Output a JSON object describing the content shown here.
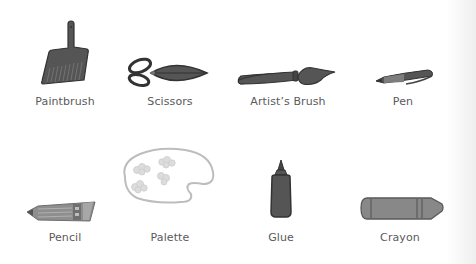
{
  "colors": {
    "icon_fill": "#555555",
    "icon_stroke": "#333333",
    "light_fill": "#8a8a8a",
    "palette_stroke": "#bdbdbd",
    "palette_spot": "#d8d8d8",
    "label_text": "#5a5a5a",
    "background": "#ffffff"
  },
  "items": [
    {
      "label": "Paintbrush",
      "icon": "paintbrush-icon"
    },
    {
      "label": "Scissors",
      "icon": "scissors-icon"
    },
    {
      "label": "Artist’s Brush",
      "icon": "artist-brush-icon"
    },
    {
      "label": "Pen",
      "icon": "pen-icon"
    },
    {
      "label": "Pencil",
      "icon": "pencil-icon"
    },
    {
      "label": "Palette",
      "icon": "palette-icon"
    },
    {
      "label": "Glue",
      "icon": "glue-icon"
    },
    {
      "label": "Crayon",
      "icon": "crayon-icon"
    }
  ]
}
